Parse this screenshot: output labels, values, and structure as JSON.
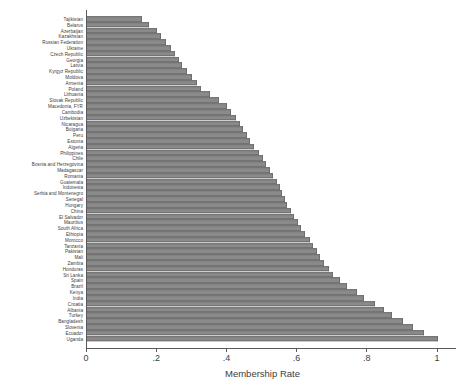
{
  "chart_data": {
    "type": "bar",
    "orientation": "horizontal",
    "title": "",
    "xlabel": "Membership Rate",
    "ylabel": "",
    "xlim": [
      0,
      1.08
    ],
    "xticks": [
      0,
      0.2,
      0.4,
      0.6,
      0.8,
      1
    ],
    "xticklabels": [
      "0",
      ".2",
      ".4",
      ".6",
      ".8",
      "1"
    ],
    "grid": false,
    "legend": false,
    "bar_color": "#8a8a8a",
    "bar_edge_color": "#6d6d6d",
    "categories": [
      "Tajikistan",
      "Belarus",
      "Azerbaijan",
      "Kazakhstan",
      "Russian Federation",
      "Ukraine",
      "Czech Republic",
      "Georgia",
      "Latvia",
      "Kyrgyz Republic",
      "Moldova",
      "Armenia",
      "Poland",
      "Lithuania",
      "Slovak Republic",
      "Macedonia, FYR",
      "Cambodia",
      "Uzbekistan",
      "Nicaragua",
      "Bulgaria",
      "Peru",
      "Estonia",
      "Algeria",
      "Philippines",
      "Chile",
      "Bosnia and Herzegovina",
      "Madagascar",
      "Romania",
      "Guatemala",
      "Indonesia",
      "Serbia and Montenegro",
      "Senegal",
      "Hungary",
      "China",
      "El Salvador",
      "Mauritius",
      "South Africa",
      "Ethiopia",
      "Morocco",
      "Tanzania",
      "Pakistan",
      "Mali",
      "Zambia",
      "Honduras",
      "Sri Lanka",
      "Spain",
      "Brazil",
      "Kenya",
      "India",
      "Croatia",
      "Albania",
      "Turkey",
      "Bangladesh",
      "Slovenia",
      "Ecuador",
      "Uganda"
    ],
    "values": [
      0.157,
      0.176,
      0.2,
      0.212,
      0.225,
      0.24,
      0.25,
      0.262,
      0.27,
      0.285,
      0.3,
      0.312,
      0.325,
      0.35,
      0.375,
      0.4,
      0.41,
      0.425,
      0.435,
      0.445,
      0.455,
      0.465,
      0.475,
      0.49,
      0.5,
      0.51,
      0.52,
      0.53,
      0.54,
      0.55,
      0.555,
      0.565,
      0.57,
      0.58,
      0.59,
      0.6,
      0.61,
      0.62,
      0.635,
      0.645,
      0.655,
      0.665,
      0.675,
      0.69,
      0.7,
      0.72,
      0.74,
      0.77,
      0.79,
      0.82,
      0.845,
      0.87,
      0.9,
      0.93,
      0.96,
      1.0
    ]
  }
}
